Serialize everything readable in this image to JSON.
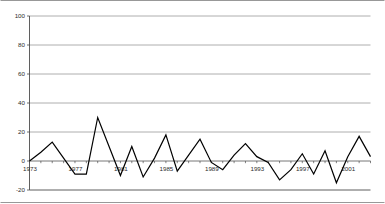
{
  "chart_data": {
    "type": "line",
    "title": "",
    "subtitle": "",
    "xlabel": "",
    "ylabel": "",
    "legend": [],
    "legend_position": "none",
    "grid": true,
    "gridlines": "horizontal",
    "xlim": [
      1973,
      2003
    ],
    "ylim": [
      -20,
      100
    ],
    "y_ticks": [
      100,
      80,
      60,
      40,
      20,
      0,
      -20
    ],
    "y_tick_labels": [
      "100",
      "80",
      "60",
      "40",
      "20",
      "0",
      "-20"
    ],
    "x_ticks": [
      1973,
      1977,
      1981,
      1985,
      1989,
      1993,
      1997,
      2001
    ],
    "x_tick_labels": [
      "1973",
      "1977",
      "1981",
      "1985",
      "1989",
      "1993",
      "1997",
      "2001"
    ],
    "x_minor_tick_interval": 1,
    "x": [
      1973,
      1974,
      1975,
      1976,
      1977,
      1978,
      1979,
      1980,
      1981,
      1982,
      1983,
      1984,
      1985,
      1986,
      1987,
      1988,
      1989,
      1990,
      1991,
      1992,
      1993,
      1994,
      1995,
      1996,
      1997,
      1998,
      1999,
      2000,
      2001,
      2002,
      2003
    ],
    "values": [
      0,
      6,
      13,
      2,
      -9,
      -9,
      30,
      10,
      -10,
      10,
      -11,
      2,
      18,
      -7,
      4,
      15,
      -1,
      -6,
      4,
      12,
      3,
      -1,
      -13,
      -6,
      5,
      -9,
      7,
      -15,
      3,
      17,
      3
    ],
    "series": [
      {
        "name": "series-1",
        "color": "#000000",
        "line_width": 1.2,
        "values": [
          0,
          6,
          13,
          2,
          -9,
          -9,
          30,
          10,
          -10,
          10,
          -11,
          2,
          18,
          -7,
          4,
          15,
          -1,
          -6,
          4,
          12,
          3,
          -1,
          -13,
          -6,
          5,
          -9,
          7,
          -15,
          3,
          17,
          3
        ]
      }
    ],
    "colors": {
      "line": "#000000",
      "grid": "#9a9a9a",
      "axis": "#4d4d4d",
      "text": "#2b2b2b",
      "background": "#ffffff",
      "border": "#7d7d7d"
    }
  }
}
